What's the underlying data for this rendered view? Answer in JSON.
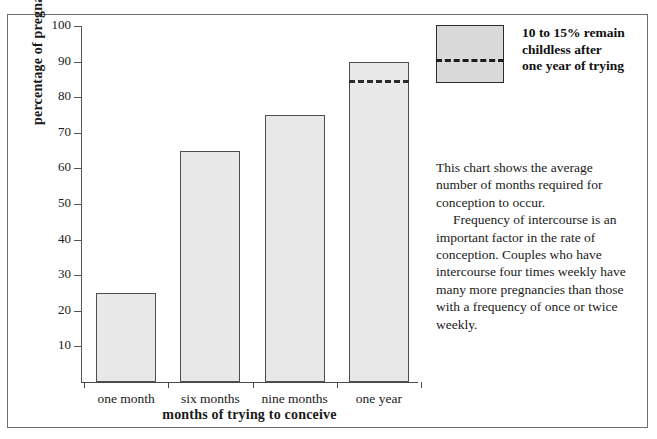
{
  "chart_data": {
    "type": "bar",
    "title": "",
    "categories": [
      "one month",
      "six months",
      "nine months",
      "one year"
    ],
    "values": [
      25,
      65,
      75,
      90
    ],
    "xlabel": "months of trying to conceive",
    "ylabel": "percentage of pregnancies",
    "ylim": [
      0,
      100
    ],
    "yticks": [
      100,
      90,
      80,
      70,
      60,
      50,
      40,
      30,
      20,
      10
    ],
    "ytick_labels": [
      "100",
      "90",
      "80",
      "70",
      "60",
      "50",
      "40",
      "30",
      "20",
      "10"
    ],
    "grid": false,
    "legend_position": "top-right",
    "bar_fill_color": "#e8e8e8",
    "bar_edge_color": "#4f4f4f",
    "annotations": [
      {
        "type": "dashed-line",
        "on_category": "one year",
        "value": 85,
        "label": "10 to 15% remain childless after one year of trying"
      }
    ],
    "legend": [
      {
        "swatch": "bar-with-dashed-line",
        "swatch_color": "#d9d9d9",
        "label_lines": [
          "10 to 15% remain",
          "childless after",
          "one year of trying"
        ]
      }
    ]
  },
  "caption": {
    "paragraph_1": "This chart shows the average number of months required for conception to occur.",
    "paragraph_2": "Frequency of intercourse is an important factor in the rate of conception. Couples who have intercourse four times weekly have many more pregnancies than those with a frequency of once or twice weekly."
  }
}
